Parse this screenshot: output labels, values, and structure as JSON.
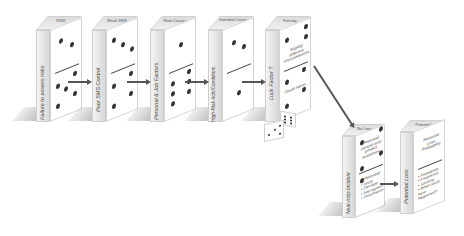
{
  "diagram": {
    "type": "domino-chain",
    "dominoes": [
      {
        "top_label": "RISK",
        "side_label": "Failure to assess risks",
        "pips_upper": 2,
        "pips_lower": 5
      },
      {
        "top_label": "Weak SMS",
        "side_label": "Poor SMS Control",
        "pips_upper": 3,
        "pips_lower": 4
      },
      {
        "top_label": "Root Causes",
        "side_label": "Personal & Job Factors",
        "pips_upper": 1,
        "pips_lower": 6
      },
      {
        "top_label": "Immediate Causes",
        "side_label": "High-Risk Acts/Conditions",
        "pips_upper": 2,
        "pips_lower": 1
      },
      {
        "top_label": "Fortuity",
        "side_label": "Luck Factor ?",
        "face_upper_text": "Slightly different circumstances",
        "face_lower_text": "Could Have..."
      },
      {
        "top_label": "No Loss",
        "side_label": "Near-miss Incident",
        "face_upper_text": "Potential control and predict outcomes",
        "face_lower_title": "Potential",
        "face_lower_items": [
          "Injury",
          "Damage",
          "Interruption",
          "Disturbance"
        ]
      },
      {
        "top_label": "Potential",
        "side_label": "Potential Loss",
        "face_upper_text": "Potential Loss Probability",
        "face_lower_items": [
          "Probability",
          "Frequency",
          "Severity",
          "What could have happened?"
        ]
      }
    ],
    "arrows": [
      {
        "from": 1,
        "to": 2
      },
      {
        "from": 2,
        "to": 3
      },
      {
        "from": 3,
        "to": 4
      },
      {
        "from": 4,
        "to": 5
      },
      {
        "from": 5,
        "to": 6
      },
      {
        "from": 6,
        "to": 7
      }
    ],
    "extras": [
      "dice-pair"
    ]
  }
}
